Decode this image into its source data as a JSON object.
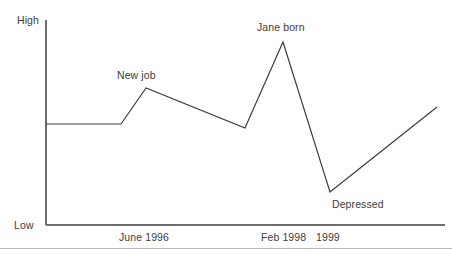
{
  "chart_data": {
    "type": "line",
    "title": "",
    "subtitle": "",
    "xlabel": "",
    "ylabel": "",
    "grid": false,
    "legend": "none",
    "axis": {
      "y_top_label": "High",
      "y_bottom_label": "Low",
      "y_range_labels": [
        "Low",
        "High"
      ],
      "x_tick_labels": [
        "June 1996",
        "Feb 1998",
        "1999"
      ]
    },
    "series": [
      {
        "name": "Mood",
        "points": [
          {
            "x": "start",
            "x_px": 46,
            "value_px": 124,
            "value": "baseline"
          },
          {
            "x": "June 1996",
            "x_px": 121,
            "value_px": 124,
            "value": "baseline"
          },
          {
            "x": "New job",
            "x_px": 146,
            "value_px": 88,
            "value": "above-baseline peak"
          },
          {
            "x": "pre-1998",
            "x_px": 245,
            "value_px": 128,
            "value": "baseline"
          },
          {
            "x": "Jane born",
            "x_px": 283,
            "value_px": 42,
            "value": "high peak"
          },
          {
            "x": "Depressed",
            "x_px": 330,
            "value_px": 192,
            "value": "low trough"
          },
          {
            "x": "end",
            "x_px": 437,
            "value_px": 107,
            "value": "above baseline"
          }
        ]
      }
    ],
    "annotations": [
      {
        "label": "New job",
        "near_x_px": 146,
        "near_y_px": 88
      },
      {
        "label": "Jane born",
        "near_x_px": 283,
        "near_y_px": 42
      },
      {
        "label": "Depressed",
        "near_x_px": 330,
        "near_y_px": 192
      }
    ],
    "colors": {
      "line": "#3a3a3a",
      "axis": "#6e6e6e",
      "text": "#3d3d3d",
      "background": "#ffffff",
      "divider": "#b9b9b9"
    }
  },
  "labels": {
    "y_high": "High",
    "y_low": "Low",
    "new_job": "New job",
    "jane_born": "Jane born",
    "depressed": "Depressed",
    "tick_june_1996": "June 1996",
    "tick_feb_1998": "Feb 1998",
    "tick_1999": "1999"
  }
}
